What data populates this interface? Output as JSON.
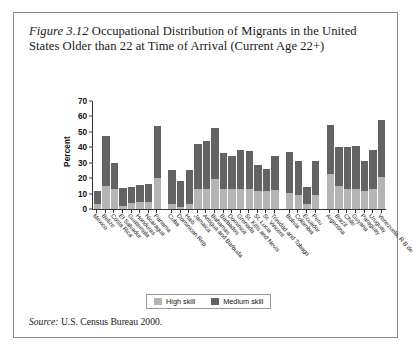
{
  "figure": {
    "number_label": "Figure 3.12",
    "title_text": " Occupational Distribution of Migrants in the United States Older than 22 at Time of Arrival (Current Age 22+)",
    "source_label": "Source:",
    "source_text": " U.S. Census Bureau 2000."
  },
  "legend": {
    "position": "bottom-center",
    "entries": [
      {
        "label": "High skill",
        "color": "#b4b4b4"
      },
      {
        "label": "Medium skill",
        "color": "#636363"
      }
    ]
  },
  "chart_data": {
    "type": "bar",
    "subtype": "stacked-vertical",
    "title": "Occupational Distribution of Migrants in the United States Older than 22 at Time of Arrival (Current Age 22+)",
    "xlabel": "",
    "ylabel": "Percent",
    "ylim": [
      0,
      70
    ],
    "ytick_step": 10,
    "yticks": [
      0,
      10,
      20,
      30,
      40,
      50,
      60,
      70
    ],
    "ytick_labels": [
      "0",
      "10",
      "20",
      "30",
      "40",
      "50",
      "60",
      "70"
    ],
    "grid": false,
    "stacked": true,
    "legend_position": "bottom-center",
    "series": [
      {
        "name": "High skill",
        "color": "#b4b4b4",
        "values": [
          3,
          15,
          13,
          2,
          4,
          4.5,
          4.5,
          20,
          3,
          1.5,
          3,
          13,
          13,
          19.5,
          13,
          13,
          13,
          13,
          12,
          12,
          12.5,
          10.5,
          9,
          3,
          9,
          23,
          15,
          13,
          13,
          12,
          13,
          21
        ]
      },
      {
        "name": "Medium skill",
        "color": "#636363",
        "values": [
          9,
          32.5,
          17,
          11.5,
          10,
          11,
          11.5,
          34,
          22,
          16.5,
          22,
          29,
          31,
          33,
          23.5,
          21.5,
          25,
          24.5,
          16.5,
          14,
          22,
          26.5,
          22,
          11.5,
          22,
          31.5,
          25,
          27.5,
          28,
          19,
          25,
          37
        ]
      }
    ],
    "categories": [
      "Mexico",
      "Belize",
      "Costa Rica",
      "El Salvador",
      "Guatemala",
      "Honduras",
      "Nicaragua",
      "Panama",
      "Cuba",
      "Dominican Rep.",
      "Haiti",
      "Jamaica",
      "Antigua and Barbuda",
      "Bahamas",
      "Barbados",
      "Dominica",
      "Grenada",
      "St. Kitts and Nevis",
      "St. Lucia",
      "St. Vincent",
      "Trinidad and Tobago",
      "Bolivia",
      "Colombia",
      "Ecuador",
      "Peru",
      "Argentina",
      "Brazil",
      "Chile",
      "Guyana",
      "Paraguay",
      "Uruguay",
      "Venezuela, R B de"
    ],
    "group_breaks_after": [
      7,
      20,
      24
    ]
  }
}
